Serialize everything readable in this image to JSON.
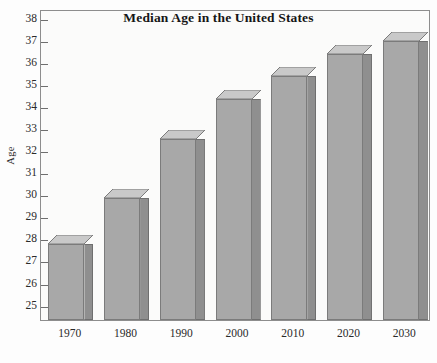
{
  "chart_data": {
    "type": "bar",
    "title": "Median Age in the United States",
    "xlabel": "",
    "ylabel": "Age",
    "categories": [
      "1970",
      "1980",
      "1990",
      "2000",
      "2010",
      "2020",
      "2030"
    ],
    "values": [
      27.75,
      29.85,
      32.5,
      34.3,
      35.35,
      36.35,
      36.95
    ],
    "ylim": [
      24.3,
      38.4
    ],
    "yticks": [
      25,
      26,
      27,
      28,
      29,
      30,
      31,
      32,
      33,
      34,
      35,
      36,
      37,
      38
    ],
    "ytick_labels": [
      "25",
      "26",
      "27",
      "28",
      "29",
      "30",
      "31",
      "32",
      "33",
      "34",
      "35",
      "36",
      "37",
      "38"
    ],
    "grid": false,
    "legend": false,
    "style": "3d-extruded-bars",
    "colors": {
      "bar_front": "#a8a8a8",
      "bar_side": "#8f8f8f",
      "bar_top": "#c9c9c9",
      "bar_outline": "#7b7b7b",
      "plot_background": "#fbfbfa",
      "plot_border": "#8d8d8d",
      "text": "#1a1a1a"
    }
  }
}
